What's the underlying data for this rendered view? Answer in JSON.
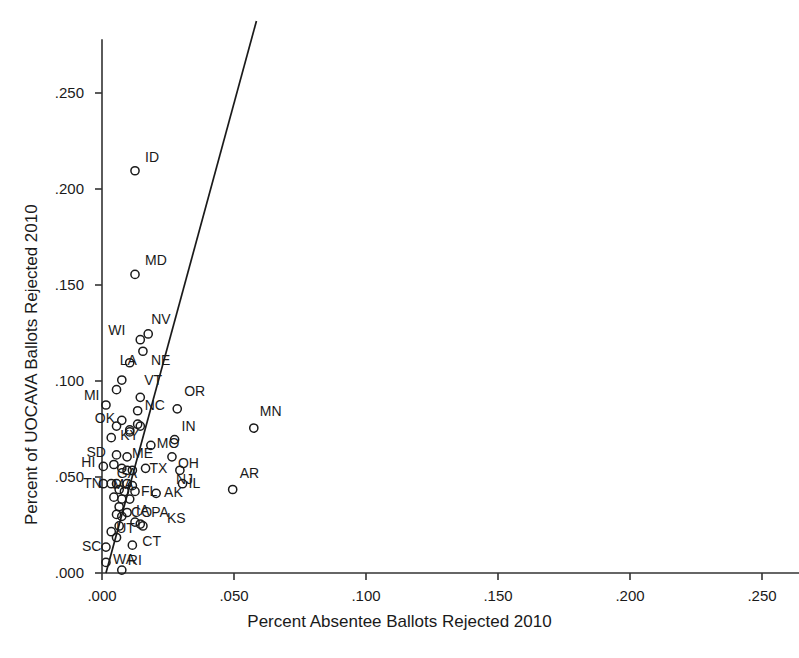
{
  "chart_data": {
    "type": "scatter",
    "title": "",
    "xlabel": "Percent Absentee Ballots Rejected 2010",
    "ylabel": "Percent of UOCAVA Ballots Rejected 2010",
    "xlim": [
      -0.004,
      0.272
    ],
    "ylim": [
      -0.004,
      0.278
    ],
    "xticks": [
      0.0,
      0.05,
      0.1,
      0.15,
      0.2,
      0.25
    ],
    "xtick_labels": [
      ".000",
      ".050",
      ".100",
      ".150",
      ".200",
      ".250"
    ],
    "yticks": [
      0.0,
      0.05,
      0.1,
      0.15,
      0.2,
      0.25
    ],
    "ytick_labels": [
      ".000",
      ".050",
      ".100",
      ".150",
      ".200",
      ".250"
    ],
    "grid": false,
    "legend": "none",
    "marker": "open-circle",
    "point_color": "#1a1a1a",
    "line_color": "#1a1a1a",
    "fit_line": {
      "name": "linear fit",
      "x0": 0.0015,
      "y0": 0.0,
      "x1": 0.0585,
      "y1": 0.2875
    },
    "points": [
      {
        "label": "ID",
        "x": 0.0125,
        "y": 0.2095,
        "lx": 10,
        "ly": -16
      },
      {
        "label": "MD",
        "x": 0.0125,
        "y": 0.1555,
        "lx": 10,
        "ly": -16
      },
      {
        "label": "NV",
        "x": 0.0175,
        "y": 0.1245,
        "lx": 3,
        "ly": -17
      },
      {
        "label": "WI",
        "x": 0.0145,
        "y": 0.1215,
        "lx": -32,
        "ly": -12
      },
      {
        "label": "NE",
        "x": 0.0155,
        "y": 0.1155,
        "lx": 8,
        "ly": 7
      },
      {
        "label": "LA",
        "x": 0.0075,
        "y": 0.1005,
        "lx": -2,
        "ly": -22
      },
      {
        "label": "VT",
        "x": 0.0145,
        "y": 0.0915,
        "lx": 4,
        "ly": -19
      },
      {
        "label": "MI",
        "x": 0.0015,
        "y": 0.0875,
        "lx": -22,
        "ly": -12
      },
      {
        "label": "NC",
        "x": 0.0135,
        "y": 0.0845,
        "lx": 7,
        "ly": -8
      },
      {
        "label": "OK",
        "x": 0.0075,
        "y": 0.0795,
        "lx": -27,
        "ly": -4
      },
      {
        "label": "OR",
        "x": 0.0285,
        "y": 0.0855,
        "lx": 7,
        "ly": -20
      },
      {
        "label": "MN",
        "x": 0.0575,
        "y": 0.0755,
        "lx": 6,
        "ly": -19
      },
      {
        "label": "KY",
        "x": 0.0035,
        "y": 0.0705,
        "lx": 9,
        "ly": -5
      },
      {
        "label": "MO",
        "x": 0.0185,
        "y": 0.0665,
        "lx": 6,
        "ly": -4
      },
      {
        "label": "IN",
        "x": 0.0275,
        "y": 0.0695,
        "lx": 7,
        "ly": -16
      },
      {
        "label": "SD",
        "x": 0.0055,
        "y": 0.0615,
        "lx": -30,
        "ly": -5
      },
      {
        "label": "ME",
        "x": 0.0095,
        "y": 0.0605,
        "lx": 5,
        "ly": -6
      },
      {
        "label": "OH",
        "x": 0.0265,
        "y": 0.0605,
        "lx": 6,
        "ly": 4
      },
      {
        "label": "HI",
        "x": 0.0005,
        "y": 0.0555,
        "lx": -22,
        "ly": -6
      },
      {
        "label": "GA",
        "x": 0.0075,
        "y": 0.0545,
        "lx": -5,
        "ly": 3
      },
      {
        "label": "TX",
        "x": 0.0165,
        "y": 0.0545,
        "lx": 4,
        "ly": -2
      },
      {
        "label": "NJ",
        "x": 0.0295,
        "y": 0.0535,
        "lx": -4,
        "ly": 7
      },
      {
        "label": "AR",
        "x": 0.0495,
        "y": 0.0435,
        "lx": 7,
        "ly": -18
      },
      {
        "label": "IL",
        "x": 0.0305,
        "y": 0.0465,
        "lx": 6,
        "ly": -3
      },
      {
        "label": "AK",
        "x": 0.0205,
        "y": 0.0415,
        "lx": 8,
        "ly": -3
      },
      {
        "label": "FL",
        "x": 0.0125,
        "y": 0.0425,
        "lx": 6,
        "ly": -2
      },
      {
        "label": "NV2",
        "x": 0.0035,
        "y": 0.0465,
        "lx": 0,
        "ly": 0,
        "hide_label": true
      },
      {
        "label": "TN",
        "x": 0.0005,
        "y": 0.0465,
        "lx": -20,
        "ly": -3
      },
      {
        "label": "MA",
        "x": 0.0055,
        "y": 0.0465,
        "lx": -4,
        "ly": -2
      },
      {
        "label": "CO",
        "x": 0.0095,
        "y": 0.0315,
        "lx": 4,
        "ly": -3
      },
      {
        "label": "IA",
        "x": 0.0125,
        "y": 0.0265,
        "lx": 1,
        "ly": -14
      },
      {
        "label": "PA",
        "x": 0.0145,
        "y": 0.0255,
        "lx": 11,
        "ly": -14
      },
      {
        "label": "KS",
        "x": 0.0155,
        "y": 0.0245,
        "lx": 24,
        "ly": -10
      },
      {
        "label": "UT",
        "x": 0.0035,
        "y": 0.0215,
        "lx": 5,
        "ly": -6
      },
      {
        "label": "CT",
        "x": 0.0115,
        "y": 0.0145,
        "lx": 10,
        "ly": -6
      },
      {
        "label": "SC",
        "x": 0.0015,
        "y": 0.0135,
        "lx": -24,
        "ly": -3
      },
      {
        "label": "WA",
        "x": 0.0015,
        "y": 0.0055,
        "lx": 7,
        "ly": -5
      },
      {
        "label": "RI",
        "x": 0.0075,
        "y": 0.0015,
        "lx": 6,
        "ly": -12
      },
      {
        "label": "NH",
        "x": 0.0045,
        "y": 0.0565,
        "lx": 0,
        "ly": 0,
        "hide_label": true
      },
      {
        "label": "CA",
        "x": 0.0065,
        "y": 0.0435,
        "lx": 0,
        "ly": 0,
        "hide_label": true
      },
      {
        "label": "AZ",
        "x": 0.0085,
        "y": 0.0425,
        "lx": 0,
        "ly": 0,
        "hide_label": true
      },
      {
        "label": "AL",
        "x": 0.0045,
        "y": 0.0395,
        "lx": 0,
        "ly": 0,
        "hide_label": true
      },
      {
        "label": "VA",
        "x": 0.0075,
        "y": 0.0385,
        "lx": 0,
        "ly": 0,
        "hide_label": true
      },
      {
        "label": "NY",
        "x": 0.0065,
        "y": 0.0345,
        "lx": 0,
        "ly": 0,
        "hide_label": true
      },
      {
        "label": "DE",
        "x": 0.0055,
        "y": 0.0305,
        "lx": 0,
        "ly": 0,
        "hide_label": true
      },
      {
        "label": "MS",
        "x": 0.0075,
        "y": 0.0295,
        "lx": 0,
        "ly": 0,
        "hide_label": true
      },
      {
        "label": "MT",
        "x": 0.0095,
        "y": 0.0465,
        "lx": 0,
        "ly": 0,
        "hide_label": true
      },
      {
        "label": "WV",
        "x": 0.0115,
        "y": 0.0455,
        "lx": 0,
        "ly": 0,
        "hide_label": true
      },
      {
        "label": "WY",
        "x": 0.0105,
        "y": 0.0385,
        "lx": 0,
        "ly": 0,
        "hide_label": true
      },
      {
        "label": "ND",
        "x": 0.0115,
        "y": 0.0535,
        "lx": 0,
        "ly": 0,
        "hide_label": true
      },
      {
        "label": "NM",
        "x": 0.0095,
        "y": 0.0535,
        "lx": 0,
        "ly": 0,
        "hide_label": true
      },
      {
        "label": "DC",
        "x": 0.0135,
        "y": 0.0775,
        "lx": 0,
        "ly": 0,
        "hide_label": true
      },
      {
        "label": "AA",
        "x": 0.0145,
        "y": 0.0765,
        "lx": 0,
        "ly": 0,
        "hide_label": true
      },
      {
        "label": "BB",
        "x": 0.0105,
        "y": 0.0745,
        "lx": 0,
        "ly": 0,
        "hide_label": true
      },
      {
        "label": "CC",
        "x": 0.0105,
        "y": 0.0735,
        "lx": 0,
        "ly": 0,
        "hide_label": true
      },
      {
        "label": "DD",
        "x": 0.0055,
        "y": 0.0955,
        "lx": 0,
        "ly": 0,
        "hide_label": true
      },
      {
        "label": "EE",
        "x": 0.0105,
        "y": 0.1095,
        "lx": 0,
        "ly": 0,
        "hide_label": true
      },
      {
        "label": "FF",
        "x": 0.0055,
        "y": 0.0765,
        "lx": 0,
        "ly": 0,
        "hide_label": true
      },
      {
        "label": "GG",
        "x": 0.0065,
        "y": 0.0245,
        "lx": 0,
        "ly": 0,
        "hide_label": true
      },
      {
        "label": "HH",
        "x": 0.0055,
        "y": 0.0185,
        "lx": 0,
        "ly": 0,
        "hide_label": true
      }
    ]
  }
}
